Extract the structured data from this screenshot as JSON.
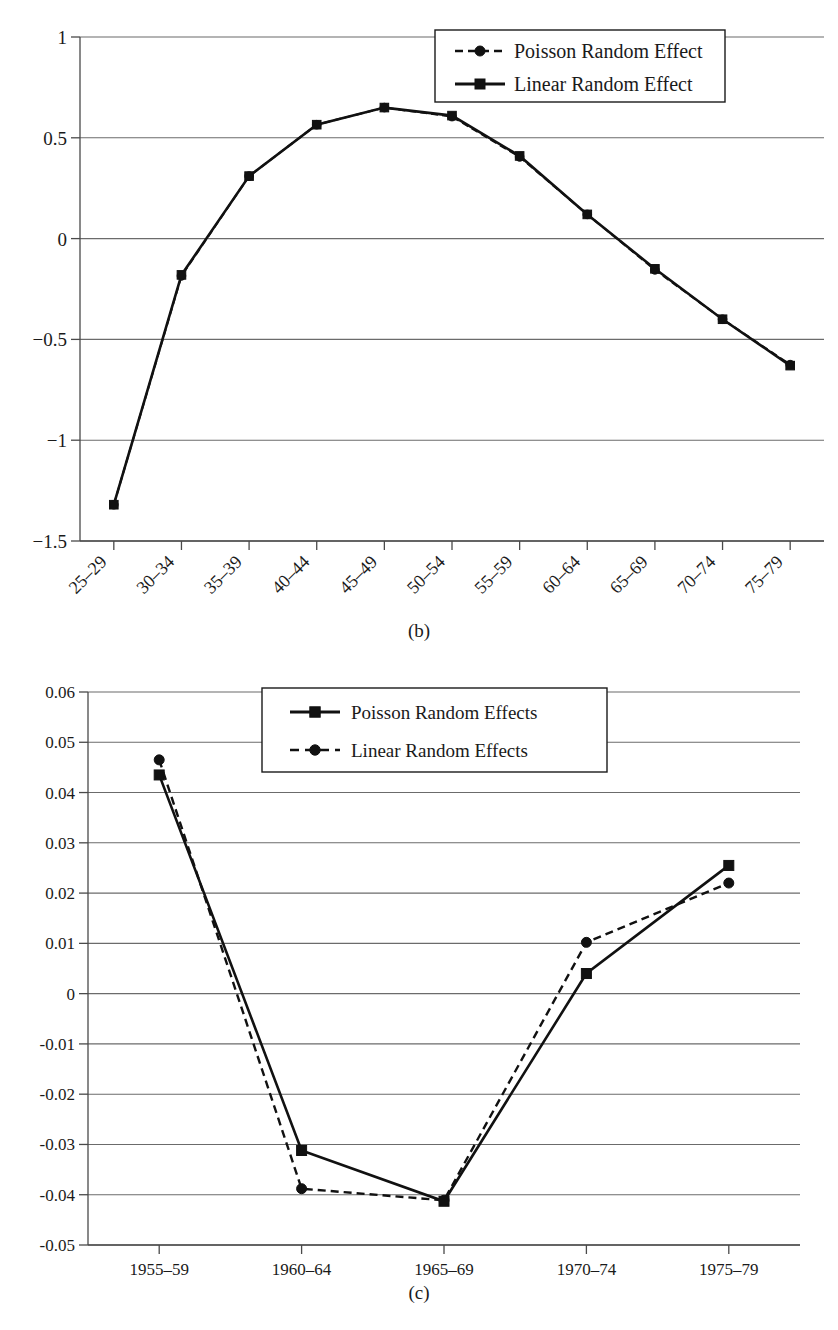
{
  "figure_b": {
    "panel_label": "(b)",
    "legend": {
      "position": "top-right",
      "items": [
        {
          "label": "Poisson Random Effect",
          "marker": "circle",
          "line_style": "dashed"
        },
        {
          "label": "Linear Random Effect",
          "marker": "square",
          "line_style": "solid"
        }
      ]
    }
  },
  "figure_c": {
    "panel_label": "(c)",
    "legend": {
      "position": "top-center",
      "items": [
        {
          "label": "Poisson Random Effects",
          "marker": "square",
          "line_style": "solid"
        },
        {
          "label": "Linear Random Effects",
          "marker": "circle",
          "line_style": "dashed"
        }
      ]
    }
  },
  "chart_data": [
    {
      "id": "chart-b",
      "type": "line",
      "title": "",
      "subtitle": "(b)",
      "xlabel": "",
      "ylabel": "",
      "categories": [
        "25–29",
        "30–34",
        "35–39",
        "40–44",
        "45–49",
        "50–54",
        "55–59",
        "60–64",
        "65–69",
        "70–74",
        "75–79"
      ],
      "ytick_labels": [
        "1",
        "0.5",
        "0",
        "−0.5",
        "−1",
        "−1.5"
      ],
      "yticks": [
        1,
        0.5,
        0,
        -0.5,
        -1,
        -1.5
      ],
      "ylim": [
        -1.5,
        1
      ],
      "grid": true,
      "legend_position": "top-right",
      "series": [
        {
          "name": "Poisson Random Effect",
          "marker": "circle",
          "line_style": "dashed",
          "values": [
            -1.32,
            -0.185,
            0.31,
            0.565,
            0.65,
            0.605,
            0.405,
            0.12,
            -0.155,
            -0.4,
            -0.625
          ]
        },
        {
          "name": "Linear Random Effect",
          "marker": "square",
          "line_style": "solid",
          "values": [
            -1.32,
            -0.18,
            0.31,
            0.565,
            0.65,
            0.61,
            0.41,
            0.12,
            -0.15,
            -0.4,
            -0.63
          ]
        }
      ]
    },
    {
      "id": "chart-c",
      "type": "line",
      "title": "",
      "subtitle": "(c)",
      "xlabel": "",
      "ylabel": "",
      "categories": [
        "1955–59",
        "1960–64",
        "1965–69",
        "1970–74",
        "1975–79"
      ],
      "ytick_labels": [
        "0.06",
        "0.05",
        "0.04",
        "0.03",
        "0.02",
        "0.01",
        "0",
        "-0.01",
        "-0.02",
        "-0.03",
        "-0.04",
        "-0.05"
      ],
      "yticks": [
        0.06,
        0.05,
        0.04,
        0.03,
        0.02,
        0.01,
        0,
        -0.01,
        -0.02,
        -0.03,
        -0.04,
        -0.05
      ],
      "ylim": [
        -0.05,
        0.06
      ],
      "grid": true,
      "legend_position": "top-center",
      "series": [
        {
          "name": "Poisson Random Effects",
          "marker": "square",
          "line_style": "solid",
          "values": [
            0.0435,
            -0.0312,
            -0.0413,
            0.004,
            0.0255
          ]
        },
        {
          "name": "Linear Random Effects",
          "marker": "circle",
          "line_style": "dashed",
          "values": [
            0.0465,
            -0.0388,
            -0.0411,
            0.0102,
            0.022
          ]
        }
      ]
    }
  ]
}
